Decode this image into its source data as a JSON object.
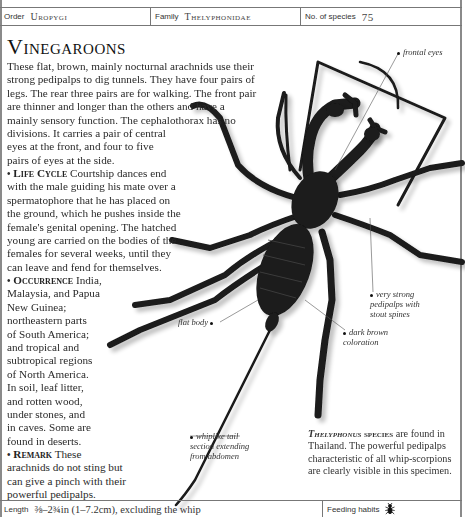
{
  "header": {
    "order_label": "Order",
    "order_value": "Uropygi",
    "family_label": "Family",
    "family_value": "Thelyphonidae",
    "species_label": "No. of species",
    "species_value": "75"
  },
  "article": {
    "title": "Vinegaroons",
    "intro_lines": [
      "These flat, brown, mainly nocturnal arachnids use their",
      "strong pedipalps to dig tunnels. They have four pairs of",
      "legs. The rear three pairs are for walking. The front pair",
      "are thinner and longer than the others and have a",
      "mainly sensory function. The cephalothorax has no",
      "divisions. It carries a pair of central",
      "eyes at the front, and four to five",
      "pairs of eyes at the side."
    ],
    "life_cycle": {
      "heading": "Life Cycle",
      "lines": [
        "Courtship dances end",
        "with the male guiding his mate over a",
        "spermatophore that he has placed on",
        "the ground, which he pushes inside the",
        "female's genital opening. The hatched",
        "young are carried on the bodies of the",
        "females for several weeks, until they",
        "can leave and fend for themselves."
      ]
    },
    "occurrence": {
      "heading": "Occurrence",
      "lines": [
        "India,",
        "Malaysia, and Papua",
        "New Guinea;",
        "northeastern parts",
        "of South America;",
        "and tropical and",
        "subtropical regions",
        "of North America.",
        "In soil, leaf litter,",
        "and rotten wood,",
        "under stones, and",
        "in caves. Some are",
        "found in deserts."
      ]
    },
    "remark": {
      "heading": "Remark",
      "lines": [
        "These",
        "arachnids do not sting but",
        "can give a pinch with their",
        "powerful pedipalps."
      ]
    }
  },
  "annotations": {
    "frontal_eyes": "frontal eyes",
    "pedipalps": [
      "very strong",
      "pedipalps with",
      "stout spines"
    ],
    "flat_body": "flat body",
    "coloration": [
      "dark brown",
      "coloration"
    ],
    "tail": [
      "whiplike tail",
      "section extending",
      "from abdomen"
    ]
  },
  "caption": {
    "species": "Thelyphonus",
    "species_suffix": "species",
    "rest": "are found in Thailand. The powerful pedipalps characteristic of all whip-scorpions are clearly visible in this specimen."
  },
  "footer": {
    "length_label": "Length",
    "length_value": "⅜–2¾in (1–7.2cm), excluding the whip",
    "feeding_label": "Feeding habits",
    "feeding_icon": "insect-icon"
  },
  "colors": {
    "rule": "#777777",
    "specimen": "#1a1a1a"
  }
}
